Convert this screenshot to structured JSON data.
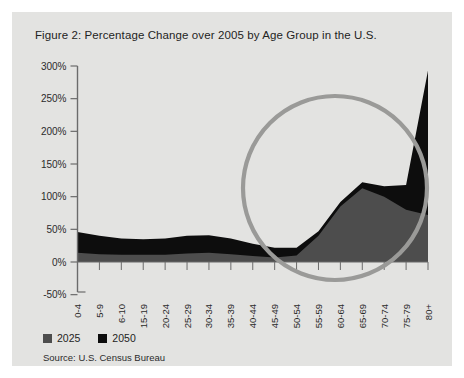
{
  "figure": {
    "title": "Figure 2: Percentage Change over 2005 by Age Group in the U.S.",
    "source": "Source: U.S. Census Bureau",
    "panel_bg": "#e3e3e1",
    "annotation": {
      "name": "highlight-circle",
      "color": "#9a9a98"
    }
  },
  "legend": {
    "items": [
      {
        "label": "2025",
        "color": "#4d4d4d"
      },
      {
        "label": "2050",
        "color": "#0d0d0d"
      }
    ]
  },
  "chart_data": {
    "type": "area",
    "title": "Figure 2: Percentage Change over 2005 by Age Group in the U.S.",
    "xlabel": "",
    "ylabel": "",
    "ylim": [
      -50,
      300
    ],
    "yticks": [
      300,
      250,
      200,
      150,
      100,
      50,
      0,
      -50
    ],
    "ytick_labels": [
      "300%",
      "250%",
      "200%",
      "150%",
      "100%",
      "50%",
      "0%",
      "-50%"
    ],
    "grid": false,
    "legend_position": "below-left",
    "categories": [
      "0-4",
      "5-9",
      "6-10",
      "15-19",
      "20-24",
      "25-29",
      "30-34",
      "35-39",
      "40-44",
      "45-49",
      "50-54",
      "55-59",
      "60-64",
      "65-69",
      "70-74",
      "75-79",
      "80+"
    ],
    "series": [
      {
        "name": "2050",
        "color": "#0d0d0d",
        "values": [
          46,
          40,
          36,
          35,
          36,
          40,
          41,
          36,
          28,
          22,
          22,
          47,
          92,
          122,
          116,
          118,
          293
        ]
      },
      {
        "name": "2025",
        "color": "#4d4d4d",
        "values": [
          14,
          12,
          11,
          11,
          11,
          13,
          14,
          12,
          9,
          7,
          10,
          40,
          85,
          113,
          100,
          80,
          72
        ]
      }
    ]
  }
}
